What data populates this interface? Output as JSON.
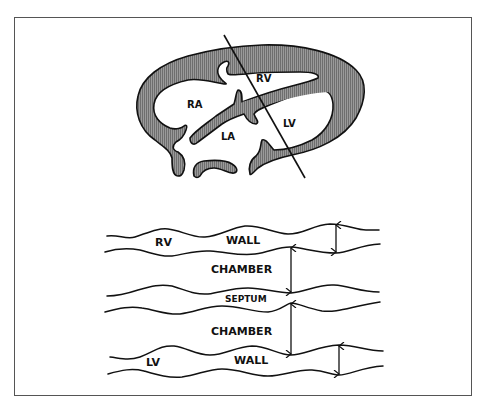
{
  "figure": {
    "colors": {
      "muscle_fill": "#8a8a8a",
      "outline": "#111111",
      "background": "#ffffff",
      "frame": "#555555"
    }
  },
  "heart_section": {
    "labels": {
      "ra": "RA",
      "rv": "RV",
      "la": "LA",
      "lv": "LV"
    },
    "cut_line": {
      "x1": 224,
      "y1": 35,
      "x2": 305,
      "y2": 178
    }
  },
  "mmode_schematic": {
    "labels": {
      "rv": "RV",
      "rv_wall": "WALL",
      "chamber_top": "CHAMBER",
      "septum": "SEPTUM",
      "chamber_bottom": "CHAMBER",
      "lv": "LV",
      "lv_wall": "WALL"
    },
    "arrows": [
      {
        "name": "rv-wall-thickness",
        "x": 336,
        "y1": 224,
        "y2": 253
      },
      {
        "name": "rv-chamber-dimension",
        "x": 291,
        "y1": 247,
        "y2": 293
      },
      {
        "name": "lv-chamber-dimension",
        "x": 291,
        "y1": 303,
        "y2": 355
      },
      {
        "name": "lv-wall-thickness",
        "x": 339,
        "y1": 345,
        "y2": 375
      }
    ]
  }
}
